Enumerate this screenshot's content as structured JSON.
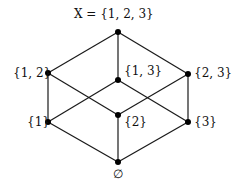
{
  "diagram": {
    "type": "hasse",
    "title": "X = {1, 2, 3}",
    "nodes": [
      {
        "id": "top",
        "label": "X = {1, 2, 3}",
        "x": 118,
        "y": 32,
        "lx": 74,
        "ly": 8
      },
      {
        "id": "12",
        "label": "{1, 2}",
        "x": 48,
        "y": 73,
        "lx": 13,
        "ly": 67
      },
      {
        "id": "13",
        "label": "{1, 3}",
        "x": 118,
        "y": 80,
        "lx": 124,
        "ly": 65
      },
      {
        "id": "23",
        "label": "{2, 3}",
        "x": 188,
        "y": 74,
        "lx": 194,
        "ly": 67
      },
      {
        "id": "1",
        "label": "{1}",
        "x": 48,
        "y": 122,
        "lx": 27,
        "ly": 116
      },
      {
        "id": "2",
        "label": "{2}",
        "x": 118,
        "y": 115,
        "lx": 124,
        "ly": 116
      },
      {
        "id": "3",
        "label": "{3}",
        "x": 188,
        "y": 122,
        "lx": 194,
        "ly": 116
      },
      {
        "id": "empty",
        "label": "∅",
        "x": 118,
        "y": 162,
        "lx": 113,
        "ly": 168
      }
    ],
    "edges": [
      [
        "top",
        "12"
      ],
      [
        "top",
        "13"
      ],
      [
        "top",
        "23"
      ],
      [
        "12",
        "1"
      ],
      [
        "12",
        "2"
      ],
      [
        "13",
        "1"
      ],
      [
        "13",
        "3"
      ],
      [
        "23",
        "2"
      ],
      [
        "23",
        "3"
      ],
      [
        "1",
        "empty"
      ],
      [
        "2",
        "empty"
      ],
      [
        "3",
        "empty"
      ]
    ]
  }
}
